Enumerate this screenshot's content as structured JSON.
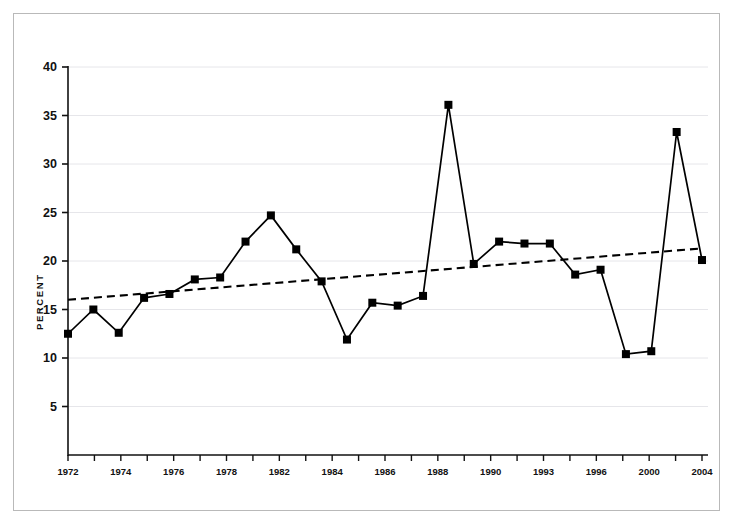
{
  "figure": {
    "background_color": "#ffffff",
    "frame_color": "#b9b9b9",
    "axis_color": "#111111",
    "gridline_color": "#e6e6ea",
    "series_color": "#000000",
    "trend_color": "#000000"
  },
  "chart_data": {
    "type": "line",
    "title": "",
    "subtitle": "",
    "xlabel": "",
    "ylabel": "PERCENT",
    "ylim": [
      0,
      40
    ],
    "xlim": [
      1972,
      2004
    ],
    "grid": true,
    "legend": false,
    "y_ticks": [
      5,
      10,
      15,
      20,
      25,
      30,
      35,
      40
    ],
    "y_tick_labels": [
      "5",
      "10",
      "15",
      "20",
      "25",
      "30",
      "35",
      "40"
    ],
    "x_tick_labels": [
      "1972",
      "",
      "1974",
      "",
      "1976",
      "",
      "1978",
      "",
      "1982",
      "",
      "1984",
      "",
      "1986",
      "",
      "1988",
      "",
      "1990",
      "",
      "1993",
      "",
      "1996",
      "",
      "2000",
      "",
      "2004"
    ],
    "x": [
      1972,
      1973,
      1974,
      1975,
      1976,
      1977,
      1978,
      1979,
      1982,
      1983,
      1984,
      1985,
      1986,
      1987,
      1988,
      1989,
      1990,
      1991,
      1992,
      1993,
      1994,
      1996,
      1998,
      2000,
      2002,
      2004
    ],
    "categories": [
      "1972",
      "1973",
      "1974",
      "1975",
      "1976",
      "1977",
      "1978",
      "1979",
      "1982",
      "1983",
      "1984",
      "1985",
      "1986",
      "1987",
      "1988",
      "1989",
      "1990",
      "1991",
      "1992",
      "1993",
      "1994",
      "1996",
      "1998",
      "2000",
      "2002",
      "2004"
    ],
    "series": [
      {
        "name": "Percent",
        "marker": "square",
        "line_style": "solid",
        "values": [
          12.5,
          15.0,
          12.6,
          16.2,
          16.6,
          18.1,
          18.3,
          22.0,
          24.7,
          21.2,
          17.9,
          11.9,
          15.7,
          15.4,
          16.4,
          36.1,
          19.7,
          22.0,
          21.8,
          21.8,
          18.6,
          19.1,
          10.4,
          10.7,
          33.3,
          20.1
        ]
      },
      {
        "name": "Trend",
        "marker": "none",
        "line_style": "dashed",
        "values": [
          16.0,
          21.3
        ],
        "x": [
          1972,
          2004
        ]
      }
    ]
  },
  "axis_label": {
    "percent": "PERCENT"
  }
}
